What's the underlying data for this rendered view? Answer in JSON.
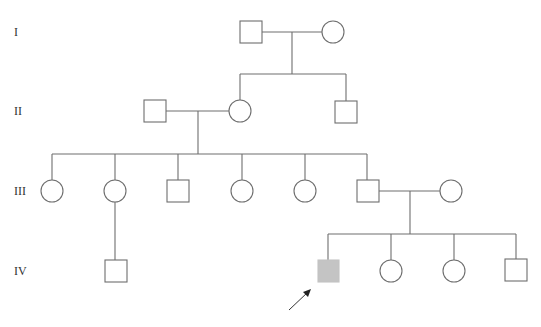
{
  "generations": [
    {
      "label": "I",
      "y": 38
    },
    {
      "label": "II",
      "y": 117
    },
    {
      "label": "III",
      "y": 197
    },
    {
      "label": "IV",
      "y": 277
    }
  ],
  "individuals": [
    {
      "id": "I-1",
      "sex": "male",
      "affected": false,
      "x": 251,
      "y": 32
    },
    {
      "id": "I-2",
      "sex": "female",
      "affected": false,
      "x": 333,
      "y": 32
    },
    {
      "id": "II-1",
      "sex": "male",
      "affected": false,
      "x": 155,
      "y": 111
    },
    {
      "id": "II-2",
      "sex": "female",
      "affected": false,
      "x": 240,
      "y": 111
    },
    {
      "id": "II-3",
      "sex": "male",
      "affected": false,
      "x": 346,
      "y": 112
    },
    {
      "id": "III-1",
      "sex": "female",
      "affected": false,
      "x": 52,
      "y": 191
    },
    {
      "id": "III-2",
      "sex": "female",
      "affected": false,
      "x": 115,
      "y": 191
    },
    {
      "id": "III-3",
      "sex": "male",
      "affected": false,
      "x": 178,
      "y": 191
    },
    {
      "id": "III-4",
      "sex": "female",
      "affected": false,
      "x": 242,
      "y": 191
    },
    {
      "id": "III-5",
      "sex": "female",
      "affected": false,
      "x": 305,
      "y": 191
    },
    {
      "id": "III-6",
      "sex": "male",
      "affected": false,
      "x": 368,
      "y": 191
    },
    {
      "id": "III-7",
      "sex": "female",
      "affected": false,
      "x": 451,
      "y": 191
    },
    {
      "id": "IV-1",
      "sex": "male",
      "affected": false,
      "x": 116,
      "y": 271
    },
    {
      "id": "IV-2",
      "sex": "male",
      "affected": true,
      "proband": true,
      "x": 328,
      "y": 271
    },
    {
      "id": "IV-3",
      "sex": "female",
      "affected": false,
      "x": 391,
      "y": 271
    },
    {
      "id": "IV-4",
      "sex": "female",
      "affected": false,
      "x": 454,
      "y": 271
    },
    {
      "id": "IV-5",
      "sex": "male",
      "affected": false,
      "x": 516,
      "y": 271
    }
  ],
  "legend": {
    "affected_color": "#c4c4c4",
    "line_color": "#6e6e6e",
    "proband_marker": "arrow"
  }
}
